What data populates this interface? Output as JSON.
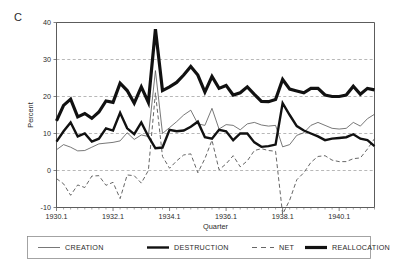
{
  "panel": {
    "label": "C"
  },
  "chart_data": {
    "type": "line",
    "title": "",
    "xlabel": "Quarter",
    "ylabel": "Percent",
    "ylim": [
      -10,
      40
    ],
    "yticks": [
      -10,
      0,
      10,
      20,
      30,
      40
    ],
    "ytick_labels": [
      "-10",
      "0",
      "10",
      "20",
      "30",
      "40"
    ],
    "gridlines_y": [
      0,
      10,
      20,
      30
    ],
    "grid": true,
    "xtick_labels": [
      "1930.1",
      "1932.1",
      "1934.1",
      "1936.1",
      "1938.1",
      "1940.1"
    ],
    "xtick_values": [
      1930.1,
      1932.1,
      1934.1,
      1936.1,
      1938.1,
      1940.1
    ],
    "xlim": [
      1930.1,
      1941.2
    ],
    "legend_position": "below-plot",
    "x": [
      "1930.1",
      "1930.2",
      "1930.3",
      "1930.4",
      "1931.1",
      "1931.2",
      "1931.3",
      "1931.4",
      "1932.1",
      "1932.2",
      "1932.3",
      "1932.4",
      "1933.1",
      "1933.2",
      "1933.3",
      "1933.4",
      "1934.1",
      "1934.2",
      "1934.3",
      "1934.4",
      "1935.1",
      "1935.2",
      "1935.3",
      "1935.4",
      "1936.1",
      "1936.2",
      "1936.3",
      "1936.4",
      "1937.1",
      "1937.2",
      "1937.3",
      "1937.4",
      "1938.1",
      "1938.2",
      "1938.3",
      "1938.4",
      "1939.1",
      "1939.2",
      "1939.3",
      "1939.4",
      "1940.1",
      "1940.2",
      "1940.3",
      "1940.4",
      "1941.1",
      "1941.2"
    ],
    "series": [
      {
        "name": "CREATION",
        "style": "thin-solid",
        "color": "#555555",
        "width": 0.8,
        "values": [
          5.6,
          7.0,
          6.3,
          5.3,
          5.4,
          6.3,
          7.2,
          7.4,
          7.6,
          8.0,
          10.2,
          8.4,
          9.6,
          9.2,
          27.0,
          10.0,
          11.6,
          13.2,
          15.0,
          16.3,
          12.6,
          12.2,
          16.8,
          11.2,
          12.4,
          12.2,
          11.0,
          12.6,
          13.0,
          12.3,
          12.0,
          12.2,
          6.4,
          7.0,
          9.5,
          10.2,
          12.2,
          13.0,
          12.2,
          11.4,
          11.2,
          11.4,
          13.0,
          12.0,
          14.0,
          15.2
        ]
      },
      {
        "name": "DESTRUCTION",
        "style": "thick-solid",
        "color": "#111111",
        "width": 2.4,
        "values": [
          7.8,
          10.6,
          13.0,
          9.2,
          10.0,
          7.8,
          8.6,
          11.4,
          10.8,
          15.6,
          11.4,
          9.8,
          13.0,
          9.2,
          6.0,
          6.2,
          11.0,
          10.6,
          10.8,
          11.8,
          13.2,
          9.0,
          8.6,
          11.0,
          10.6,
          8.2,
          10.0,
          10.0,
          7.6,
          6.4,
          6.6,
          7.0,
          18.2,
          15.0,
          12.0,
          10.8,
          10.0,
          9.2,
          8.2,
          8.6,
          8.8,
          9.0,
          9.8,
          8.6,
          8.2,
          6.6
        ]
      },
      {
        "name": "NET",
        "style": "dashed",
        "color": "#555555",
        "width": 0.9,
        "values": [
          -2.2,
          -3.6,
          -6.7,
          -3.9,
          -4.6,
          -1.5,
          -1.4,
          -4.0,
          -3.2,
          -7.6,
          -1.2,
          -1.4,
          -3.4,
          0.0,
          21.0,
          3.8,
          0.6,
          2.6,
          4.2,
          4.5,
          -0.6,
          3.2,
          8.2,
          0.2,
          1.8,
          4.0,
          1.0,
          2.6,
          5.4,
          5.9,
          5.4,
          5.2,
          -11.8,
          -8.0,
          -2.5,
          -0.6,
          2.2,
          3.8,
          4.0,
          2.8,
          2.4,
          2.4,
          3.2,
          3.4,
          5.8,
          8.6
        ]
      },
      {
        "name": "REALLOCATION",
        "style": "extra-thick-solid",
        "color": "#111111",
        "width": 3.2,
        "values": [
          13.4,
          17.6,
          19.3,
          14.5,
          15.4,
          14.1,
          15.8,
          18.8,
          18.4,
          23.6,
          21.6,
          18.2,
          22.6,
          18.4,
          38.2,
          21.6,
          22.6,
          23.8,
          25.8,
          28.1,
          25.8,
          21.2,
          25.4,
          22.2,
          23.0,
          20.4,
          21.0,
          22.6,
          20.6,
          18.7,
          18.6,
          19.2,
          24.6,
          22.0,
          21.5,
          21.0,
          22.2,
          22.2,
          20.4,
          20.0,
          20.0,
          20.4,
          22.8,
          20.6,
          22.2,
          21.8
        ]
      }
    ],
    "legend": [
      {
        "label": "CREATION",
        "style": "thin-solid"
      },
      {
        "label": "DESTRUCTION",
        "style": "thick-solid"
      },
      {
        "label": "NET",
        "style": "dashed"
      },
      {
        "label": "REALLOCATION",
        "style": "extra-thick-solid"
      }
    ]
  }
}
